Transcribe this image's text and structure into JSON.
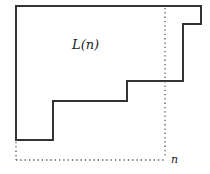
{
  "diagram": {
    "region_label": "L(n)",
    "axis_label": "n",
    "colors": {
      "outline": "#333333",
      "dotted": "#555555",
      "background": "#ffffff"
    },
    "outline_points": "16,6 201,6 201,24 183,24 183,81 127,81 127,101 53,101 53,140 16,140",
    "dotted_vertical": {
      "x": 165,
      "y1": 8,
      "y2": 158
    },
    "dotted_horizontal": {
      "y": 160,
      "x1": 16,
      "x2": 165
    },
    "dotted_left": {
      "x": 16,
      "y1": 142,
      "y2": 160
    }
  }
}
